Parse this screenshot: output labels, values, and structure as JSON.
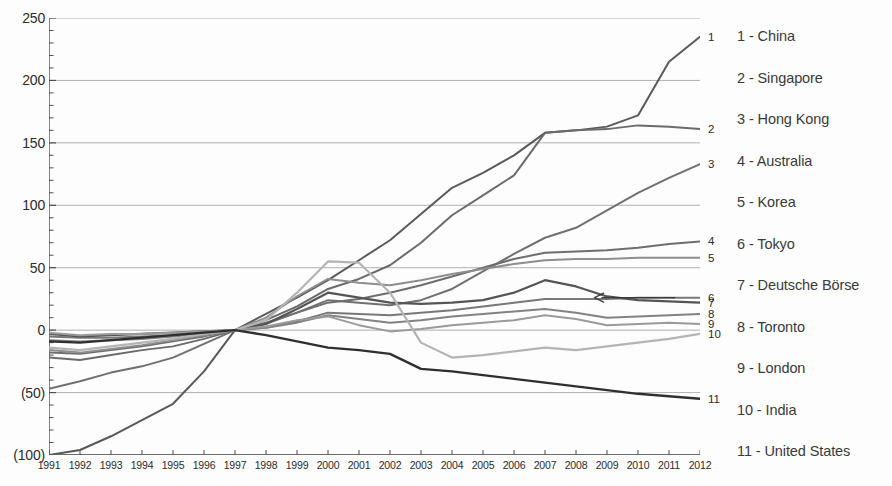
{
  "chart_data": {
    "type": "line",
    "title": "",
    "subtitle": "",
    "xlabel": "",
    "ylabel": "",
    "grid": true,
    "legend_position": "right",
    "note": "Indexed cumulative change, all series rebased to 0 at 1997",
    "xlim": [
      1991,
      2012
    ],
    "ylim": [
      -100,
      250
    ],
    "yticks": [
      250,
      200,
      150,
      100,
      50,
      0,
      -50,
      -100
    ],
    "ytick_labels": [
      "250",
      "200",
      "150",
      "100",
      "50",
      "0",
      "(50)",
      "(100)"
    ],
    "x": [
      1991,
      1992,
      1993,
      1994,
      1995,
      1996,
      1997,
      1998,
      1999,
      2000,
      2001,
      2002,
      2003,
      2004,
      2005,
      2006,
      2007,
      2008,
      2009,
      2010,
      2011,
      2012
    ],
    "xtick_labels": [
      "1991",
      "1992",
      "1993",
      "1994",
      "1995",
      "1996",
      "1997",
      "1998",
      "1999",
      "2000",
      "2001",
      "2002",
      "2003",
      "2004",
      "2005",
      "2006",
      "2007",
      "2008",
      "2009",
      "2010",
      "2011",
      "2012"
    ],
    "series": [
      {
        "name": "China",
        "index": 1,
        "end_label": "1",
        "color": "#595959",
        "width": 2.0,
        "values": [
          -100,
          -96,
          -85,
          -72,
          -59,
          -33,
          0,
          13,
          26,
          40,
          56,
          72,
          93,
          114,
          126,
          140,
          158,
          160,
          163,
          172,
          215,
          235
        ]
      },
      {
        "name": "Singapore",
        "index": 2,
        "end_label": "2",
        "color": "#6b6b6b",
        "width": 2.0,
        "values": [
          -22,
          -24,
          -20,
          -16,
          -13,
          -7,
          0,
          8,
          19,
          33,
          41,
          52,
          70,
          92,
          108,
          124,
          158,
          160,
          161,
          164,
          163,
          161
        ]
      },
      {
        "name": "Hong Kong",
        "index": 3,
        "end_label": "3",
        "color": "#707070",
        "width": 2.0,
        "values": [
          -47,
          -41,
          -34,
          -29,
          -22,
          -11,
          0,
          5,
          14,
          24,
          22,
          20,
          24,
          33,
          47,
          61,
          74,
          82,
          96,
          110,
          122,
          133
        ]
      },
      {
        "name": "Australia",
        "index": 4,
        "end_label": "4",
        "color": "#6e6e6e",
        "width": 2.0,
        "values": [
          -18,
          -19,
          -16,
          -13,
          -9,
          -5,
          0,
          6,
          14,
          22,
          25,
          30,
          36,
          43,
          50,
          57,
          62,
          63,
          64,
          66,
          69,
          71
        ]
      },
      {
        "name": "Korea",
        "index": 5,
        "end_label": "5",
        "color": "#8e8e8e",
        "width": 2.0,
        "values": [
          -16,
          -18,
          -15,
          -12,
          -8,
          -4,
          0,
          10,
          27,
          41,
          38,
          36,
          40,
          45,
          49,
          53,
          56,
          57,
          57,
          58,
          58,
          58
        ]
      },
      {
        "name": "Tokyo",
        "index": 6,
        "end_label": "6",
        "color": "#787878",
        "width": 2.0,
        "values": [
          -5,
          -6,
          -6,
          -5,
          -4,
          -2,
          0,
          2,
          7,
          14,
          13,
          12,
          14,
          16,
          19,
          22,
          25,
          25,
          25,
          26,
          26,
          26
        ]
      },
      {
        "name": "Deutsche Börse",
        "index": 7,
        "end_label": "7",
        "color": "#555555",
        "width": 2.2,
        "values": [
          -3,
          -5,
          -4,
          -3,
          -2,
          -1,
          0,
          5,
          17,
          30,
          26,
          22,
          21,
          22,
          24,
          30,
          40,
          35,
          27,
          24,
          23,
          22
        ]
      },
      {
        "name": "Toronto",
        "index": 8,
        "end_label": "8",
        "color": "#828282",
        "width": 2.0,
        "values": [
          -8,
          -9,
          -8,
          -7,
          -5,
          -3,
          0,
          2,
          6,
          12,
          9,
          6,
          8,
          11,
          13,
          15,
          17,
          14,
          10,
          11,
          12,
          13
        ]
      },
      {
        "name": "London",
        "index": 9,
        "end_label": "9",
        "color": "#9a9a9a",
        "width": 2.0,
        "values": [
          -2,
          -4,
          -3,
          -3,
          -2,
          -1,
          0,
          3,
          8,
          11,
          4,
          -1,
          1,
          4,
          6,
          8,
          12,
          9,
          4,
          5,
          6,
          5
        ]
      },
      {
        "name": "India",
        "index": 10,
        "end_label": "10",
        "color": "#b4b4b4",
        "width": 2.2,
        "values": [
          -14,
          -16,
          -13,
          -10,
          -7,
          -3,
          0,
          8,
          30,
          55,
          54,
          30,
          -10,
          -22,
          -20,
          -17,
          -14,
          -16,
          -13,
          -10,
          -7,
          -3
        ]
      },
      {
        "name": "United States",
        "index": 11,
        "end_label": "11",
        "color": "#2f2f2f",
        "width": 2.4,
        "values": [
          -9,
          -10,
          -8,
          -6,
          -4,
          -2,
          0,
          -4,
          -9,
          -14,
          -16,
          -19,
          -31,
          -33,
          -36,
          -39,
          -42,
          -45,
          -48,
          -51,
          -53,
          -55
        ]
      }
    ],
    "annotations": [
      {
        "type": "arrow",
        "label": "",
        "points_to_series": "Tokyo",
        "direction": "left",
        "x_start": 2011.2,
        "x_end": 2008.6,
        "y": 26
      }
    ]
  },
  "y_axis": {
    "ticks": [
      {
        "label": "250",
        "value": 250
      },
      {
        "label": "200",
        "value": 200
      },
      {
        "label": "150",
        "value": 150
      },
      {
        "label": "100",
        "value": 100
      },
      {
        "label": "50",
        "value": 50
      },
      {
        "label": "0",
        "value": 0
      },
      {
        "label": "(50)",
        "value": -50
      },
      {
        "label": "(100)",
        "value": -100
      }
    ]
  },
  "legend": {
    "items": [
      {
        "label": "1 - China"
      },
      {
        "label": "2 - Singapore"
      },
      {
        "label": "3 - Hong Kong"
      },
      {
        "label": "4 - Australia"
      },
      {
        "label": "5 - Korea"
      },
      {
        "label": "6 - Tokyo"
      },
      {
        "label": "7 - Deutsche Börse"
      },
      {
        "label": "8 - Toronto"
      },
      {
        "label": "9 - London"
      },
      {
        "label": "10 - India"
      },
      {
        "label": "11 - United States"
      }
    ]
  },
  "colors": {
    "gridline": "#a8a8a8",
    "axis": "#4d4d4d",
    "text": "#2b2b2b",
    "background": "#fdfdfd"
  }
}
